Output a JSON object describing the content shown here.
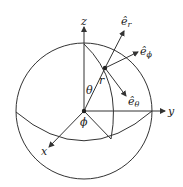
{
  "diagram": {
    "axes": {
      "x": "x",
      "y": "y",
      "z": "z"
    },
    "angles": {
      "polar": "θ",
      "azimuth": "ϕ"
    },
    "radius": "r",
    "unit_vectors": {
      "e_r": "ê",
      "e_r_sub": "r",
      "e_phi": "ê",
      "e_phi_sub": "ϕ",
      "e_theta": "ê",
      "e_theta_sub": "θ"
    },
    "colors": {
      "stroke": "#333333",
      "background": "#ffffff"
    }
  }
}
